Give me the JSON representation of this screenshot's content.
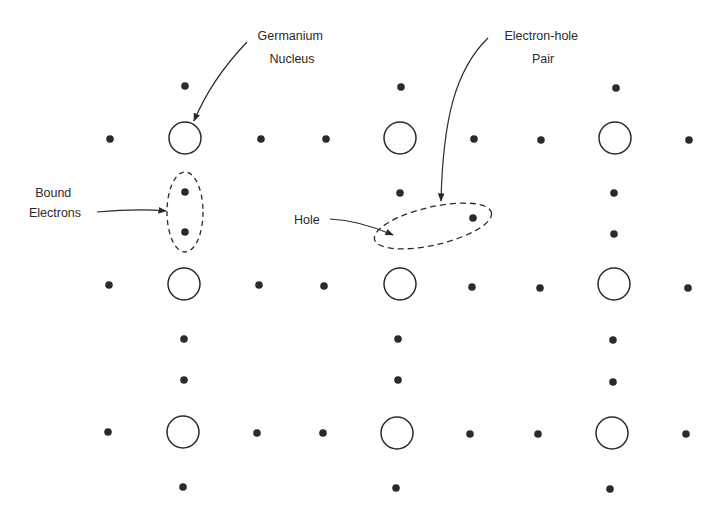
{
  "diagram": {
    "colors": {
      "ink": "#2a2a2a",
      "background": "#ffffff"
    },
    "nuclei": [
      {
        "x": 185,
        "y": 138
      },
      {
        "x": 400,
        "y": 138
      },
      {
        "x": 615,
        "y": 138
      },
      {
        "x": 184,
        "y": 284
      },
      {
        "x": 400,
        "y": 284
      },
      {
        "x": 614,
        "y": 284
      },
      {
        "x": 183,
        "y": 432
      },
      {
        "x": 397,
        "y": 433
      },
      {
        "x": 612,
        "y": 433
      }
    ],
    "electrons": [
      {
        "x": 185,
        "y": 86
      },
      {
        "x": 401,
        "y": 87
      },
      {
        "x": 616,
        "y": 88
      },
      {
        "x": 110,
        "y": 139
      },
      {
        "x": 261,
        "y": 139
      },
      {
        "x": 326,
        "y": 139
      },
      {
        "x": 474,
        "y": 139
      },
      {
        "x": 541,
        "y": 140
      },
      {
        "x": 689,
        "y": 140
      },
      {
        "x": 185,
        "y": 192
      },
      {
        "x": 185,
        "y": 232
      },
      {
        "x": 400,
        "y": 193
      },
      {
        "x": 473,
        "y": 218
      },
      {
        "x": 614,
        "y": 193
      },
      {
        "x": 614,
        "y": 234
      },
      {
        "x": 109,
        "y": 285
      },
      {
        "x": 259,
        "y": 285
      },
      {
        "x": 324,
        "y": 286
      },
      {
        "x": 472,
        "y": 287
      },
      {
        "x": 540,
        "y": 288
      },
      {
        "x": 688,
        "y": 288
      },
      {
        "x": 184,
        "y": 339
      },
      {
        "x": 184,
        "y": 380
      },
      {
        "x": 398,
        "y": 339
      },
      {
        "x": 398,
        "y": 380
      },
      {
        "x": 613,
        "y": 340
      },
      {
        "x": 613,
        "y": 382
      },
      {
        "x": 108,
        "y": 432
      },
      {
        "x": 257,
        "y": 433
      },
      {
        "x": 323,
        "y": 433
      },
      {
        "x": 470,
        "y": 434
      },
      {
        "x": 538,
        "y": 434
      },
      {
        "x": 686,
        "y": 434
      },
      {
        "x": 183,
        "y": 487
      },
      {
        "x": 396,
        "y": 488
      },
      {
        "x": 610,
        "y": 489
      }
    ],
    "labels": {
      "germanium_nucleus": [
        "Germanium",
        "Nucleus"
      ],
      "electron_hole_pair": [
        "Electron-hole",
        "Pair"
      ],
      "bound_electrons": [
        "Bound",
        "Electrons"
      ],
      "hole": "Hole"
    }
  }
}
